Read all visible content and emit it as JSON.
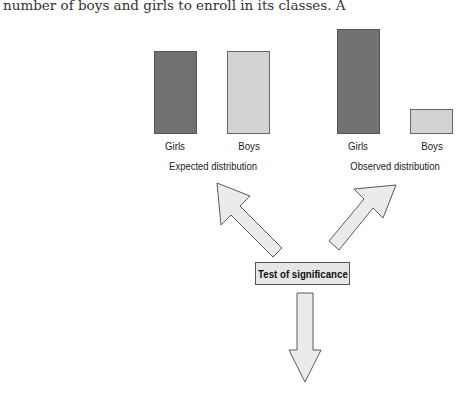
{
  "page_text": {
    "top_left_line": "number of boys and girls to enroll in its classes. A",
    "top_right_fragment": "value?"
  },
  "diagram": {
    "expected": {
      "caption": "Expected distribution",
      "bars": [
        {
          "label": "Girls",
          "shade": "dark",
          "relative_height": 82
        },
        {
          "label": "Boys",
          "shade": "light",
          "relative_height": 82
        }
      ]
    },
    "observed": {
      "caption": "Observed distribution",
      "bars": [
        {
          "label": "Girls",
          "shade": "dark",
          "relative_height": 104
        },
        {
          "label": "Boys",
          "shade": "light",
          "relative_height": 25
        }
      ]
    },
    "center_box": "Test of significance",
    "arrows": [
      {
        "from": "Test of significance",
        "to": "Expected distribution",
        "direction": "up-left"
      },
      {
        "from": "Test of significance",
        "to": "Observed distribution",
        "direction": "up-right"
      },
      {
        "from": "Test of significance",
        "to": "result",
        "direction": "down"
      }
    ],
    "colors": {
      "dark_bar": "#727272",
      "light_bar": "#d3d3d3",
      "arrow_fill": "#ebebeb",
      "box_fill": "#e6e6e6",
      "outline": "#555555"
    }
  }
}
